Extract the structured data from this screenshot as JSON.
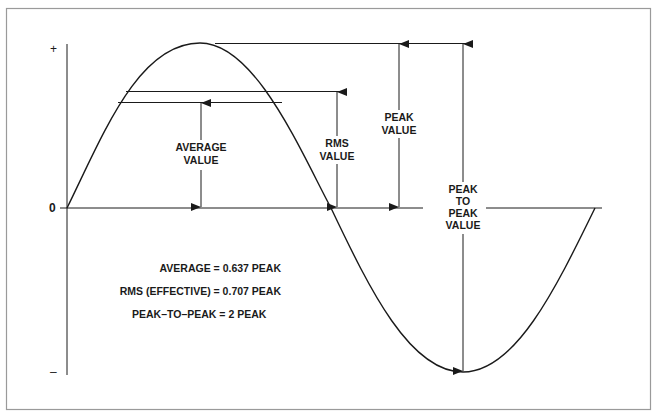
{
  "diagram": {
    "type": "sine-wave-ac-values",
    "axis": {
      "plus_label": "+",
      "zero_label": "0",
      "minus_label": "–"
    },
    "labels": {
      "average": [
        "AVERAGE",
        "VALUE"
      ],
      "rms": [
        "RMS",
        "VALUE"
      ],
      "peak": [
        "PEAK",
        "VALUE"
      ],
      "peak_to_peak": [
        "PEAK",
        "TO",
        "PEAK",
        "VALUE"
      ]
    },
    "formulas": [
      "AVERAGE = 0.637 PEAK",
      "RMS (EFFECTIVE) = 0.707 PEAK",
      "PEAK–TO–PEAK = 2 PEAK"
    ],
    "colors": {
      "line": "#1a1a1a",
      "frame": "#9a9a9a",
      "background": "#ffffff"
    }
  }
}
